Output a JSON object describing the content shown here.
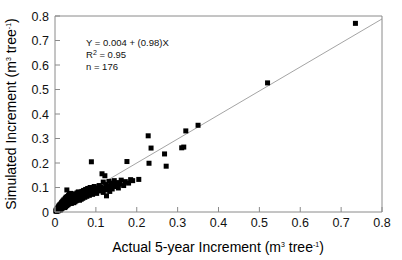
{
  "chart_data": {
    "type": "scatter",
    "title": "",
    "xlabel": "Actual 5-year Increment (m³ tree⁻¹)",
    "ylabel": "Simulated Increment (m³ tree⁻¹)",
    "xlabel_parts": {
      "main": "Actual 5-year Increment (m",
      "sup1": "3",
      "mid": " tree",
      "sup2": "-1",
      "end": ")"
    },
    "ylabel_parts": {
      "main": "Simulated Increment (m",
      "sup1": "3",
      "mid": " tree",
      "sup2": "-1",
      "end": ")"
    },
    "xlim": [
      0,
      0.8
    ],
    "ylim": [
      0,
      0.8
    ],
    "xticks": [
      "0",
      "0.1",
      "0.2",
      "0.3",
      "0.4",
      "0.5",
      "0.6",
      "0.7",
      "0.8"
    ],
    "yticks": [
      "0",
      "0.1",
      "0.2",
      "0.3",
      "0.4",
      "0.5",
      "0.6",
      "0.7",
      "0.8"
    ],
    "xtick_values": [
      0,
      0.1,
      0.2,
      0.3,
      0.4,
      0.5,
      0.6,
      0.7,
      0.8
    ],
    "ytick_values": [
      0,
      0.1,
      0.2,
      0.3,
      0.4,
      0.5,
      0.6,
      0.7,
      0.8
    ],
    "grid": false,
    "legend": false,
    "marker_shape": "square",
    "marker_color": "#000000",
    "marker_size": 5,
    "fit_line": {
      "slope": 0.98,
      "intercept": 0.004,
      "color": "#9a9a9a",
      "x_start": 0.0,
      "x_end": 0.8
    },
    "annotation": {
      "equation_prefix": "Y  =  0.004 + (0.98)X",
      "r2_symbol": "R",
      "r2_sup": "2",
      "r2_value": " =  0.95",
      "n_label": "n  =  176"
    },
    "n_points": 176,
    "points": [
      [
        0.002,
        0.004
      ],
      [
        0.003,
        0.008
      ],
      [
        0.004,
        0.003
      ],
      [
        0.005,
        0.012
      ],
      [
        0.005,
        0.006
      ],
      [
        0.006,
        0.016
      ],
      [
        0.006,
        0.009
      ],
      [
        0.007,
        0.004
      ],
      [
        0.008,
        0.018
      ],
      [
        0.008,
        0.011
      ],
      [
        0.009,
        0.022
      ],
      [
        0.009,
        0.007
      ],
      [
        0.01,
        0.015
      ],
      [
        0.01,
        0.026
      ],
      [
        0.011,
        0.01
      ],
      [
        0.011,
        0.02
      ],
      [
        0.012,
        0.03
      ],
      [
        0.012,
        0.014
      ],
      [
        0.013,
        0.024
      ],
      [
        0.013,
        0.008
      ],
      [
        0.014,
        0.018
      ],
      [
        0.014,
        0.033
      ],
      [
        0.015,
        0.012
      ],
      [
        0.015,
        0.026
      ],
      [
        0.016,
        0.021
      ],
      [
        0.016,
        0.038
      ],
      [
        0.017,
        0.015
      ],
      [
        0.017,
        0.029
      ],
      [
        0.018,
        0.024
      ],
      [
        0.018,
        0.042
      ],
      [
        0.019,
        0.018
      ],
      [
        0.019,
        0.032
      ],
      [
        0.02,
        0.027
      ],
      [
        0.02,
        0.046
      ],
      [
        0.021,
        0.021
      ],
      [
        0.021,
        0.036
      ],
      [
        0.022,
        0.03
      ],
      [
        0.022,
        0.05
      ],
      [
        0.023,
        0.025
      ],
      [
        0.023,
        0.04
      ],
      [
        0.024,
        0.034
      ],
      [
        0.024,
        0.018
      ],
      [
        0.025,
        0.029
      ],
      [
        0.025,
        0.055
      ],
      [
        0.026,
        0.044
      ],
      [
        0.026,
        0.022
      ],
      [
        0.027,
        0.038
      ],
      [
        0.027,
        0.06
      ],
      [
        0.028,
        0.033
      ],
      [
        0.028,
        0.048
      ],
      [
        0.029,
        0.026
      ],
      [
        0.029,
        0.09
      ],
      [
        0.03,
        0.042
      ],
      [
        0.03,
        0.063
      ],
      [
        0.031,
        0.036
      ],
      [
        0.031,
        0.052
      ],
      [
        0.032,
        0.03
      ],
      [
        0.032,
        0.046
      ],
      [
        0.033,
        0.067
      ],
      [
        0.033,
        0.04
      ],
      [
        0.034,
        0.056
      ],
      [
        0.034,
        0.034
      ],
      [
        0.035,
        0.05
      ],
      [
        0.035,
        0.072
      ],
      [
        0.036,
        0.044
      ],
      [
        0.036,
        0.06
      ],
      [
        0.037,
        0.038
      ],
      [
        0.037,
        0.054
      ],
      [
        0.038,
        0.076
      ],
      [
        0.038,
        0.048
      ],
      [
        0.039,
        0.064
      ],
      [
        0.039,
        0.042
      ],
      [
        0.04,
        0.058
      ],
      [
        0.04,
        0.035
      ],
      [
        0.041,
        0.052
      ],
      [
        0.041,
        0.068
      ],
      [
        0.042,
        0.046
      ],
      [
        0.042,
        0.062
      ],
      [
        0.043,
        0.04
      ],
      [
        0.043,
        0.056
      ],
      [
        0.044,
        0.072
      ],
      [
        0.044,
        0.05
      ],
      [
        0.045,
        0.066
      ],
      [
        0.045,
        0.044
      ],
      [
        0.046,
        0.06
      ],
      [
        0.046,
        0.038
      ],
      [
        0.047,
        0.054
      ],
      [
        0.047,
        0.07
      ],
      [
        0.048,
        0.048
      ],
      [
        0.048,
        0.064
      ],
      [
        0.049,
        0.042
      ],
      [
        0.05,
        0.058
      ],
      [
        0.05,
        0.074
      ],
      [
        0.051,
        0.052
      ],
      [
        0.052,
        0.068
      ],
      [
        0.052,
        0.046
      ],
      [
        0.053,
        0.062
      ],
      [
        0.054,
        0.078
      ],
      [
        0.054,
        0.056
      ],
      [
        0.055,
        0.072
      ],
      [
        0.056,
        0.05
      ],
      [
        0.056,
        0.066
      ],
      [
        0.057,
        0.082
      ],
      [
        0.058,
        0.06
      ],
      [
        0.058,
        0.076
      ],
      [
        0.059,
        0.054
      ],
      [
        0.06,
        0.07
      ],
      [
        0.06,
        0.048
      ],
      [
        0.061,
        0.064
      ],
      [
        0.062,
        0.08
      ],
      [
        0.063,
        0.058
      ],
      [
        0.064,
        0.074
      ],
      [
        0.064,
        0.052
      ],
      [
        0.065,
        0.068
      ],
      [
        0.066,
        0.084
      ],
      [
        0.067,
        0.062
      ],
      [
        0.068,
        0.078
      ],
      [
        0.068,
        0.056
      ],
      [
        0.069,
        0.072
      ],
      [
        0.07,
        0.088
      ],
      [
        0.071,
        0.066
      ],
      [
        0.072,
        0.082
      ],
      [
        0.073,
        0.06
      ],
      [
        0.074,
        0.076
      ],
      [
        0.075,
        0.092
      ],
      [
        0.076,
        0.07
      ],
      [
        0.077,
        0.086
      ],
      [
        0.078,
        0.064
      ],
      [
        0.079,
        0.08
      ],
      [
        0.08,
        0.096
      ],
      [
        0.081,
        0.074
      ],
      [
        0.082,
        0.09
      ],
      [
        0.084,
        0.068
      ],
      [
        0.085,
        0.084
      ],
      [
        0.086,
        0.1
      ],
      [
        0.088,
        0.078
      ],
      [
        0.089,
        0.205
      ],
      [
        0.09,
        0.094
      ],
      [
        0.092,
        0.072
      ],
      [
        0.094,
        0.088
      ],
      [
        0.096,
        0.104
      ],
      [
        0.098,
        0.082
      ],
      [
        0.1,
        0.098
      ],
      [
        0.102,
        0.076
      ],
      [
        0.105,
        0.092
      ],
      [
        0.108,
        0.108
      ],
      [
        0.11,
        0.086
      ],
      [
        0.112,
        0.102
      ],
      [
        0.115,
        0.156
      ],
      [
        0.118,
        0.122
      ],
      [
        0.118,
        0.08
      ],
      [
        0.12,
        0.096
      ],
      [
        0.122,
        0.148
      ],
      [
        0.124,
        0.112
      ],
      [
        0.126,
        0.066
      ],
      [
        0.128,
        0.09
      ],
      [
        0.13,
        0.106
      ],
      [
        0.132,
        0.125
      ],
      [
        0.134,
        0.084
      ],
      [
        0.136,
        0.1
      ],
      [
        0.138,
        0.118
      ],
      [
        0.14,
        0.094
      ],
      [
        0.142,
        0.11
      ],
      [
        0.145,
        0.128
      ],
      [
        0.148,
        0.104
      ],
      [
        0.152,
        0.12
      ],
      [
        0.155,
        0.098
      ],
      [
        0.158,
        0.114
      ],
      [
        0.162,
        0.13
      ],
      [
        0.168,
        0.108
      ],
      [
        0.172,
        0.124
      ],
      [
        0.176,
        0.206
      ],
      [
        0.18,
        0.118
      ],
      [
        0.185,
        0.132
      ],
      [
        0.19,
        0.128
      ],
      [
        0.205,
        0.133
      ],
      [
        0.228,
        0.311
      ],
      [
        0.23,
        0.199
      ],
      [
        0.235,
        0.261
      ],
      [
        0.268,
        0.237
      ],
      [
        0.272,
        0.187
      ],
      [
        0.31,
        0.262
      ],
      [
        0.315,
        0.265
      ],
      [
        0.32,
        0.331
      ],
      [
        0.35,
        0.354
      ],
      [
        0.52,
        0.527
      ],
      [
        0.735,
        0.77
      ]
    ]
  }
}
